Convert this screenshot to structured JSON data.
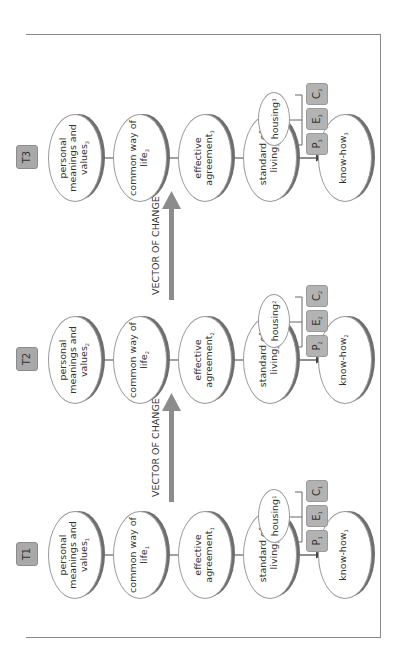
{
  "diagram": {
    "orientation": "rotated -90deg (text reads bottom-to-top)",
    "arrow_color": "#8c8c8c",
    "box_color": "#a9a9a9",
    "ellipse_shadow_color": "#6e6e6e",
    "vector_label": "VECTOR OF CHANGE",
    "stages": [
      {
        "label": "T1",
        "nodes": {
          "values": "personal meanings and values",
          "values_sub": "1",
          "way_of_life": "common way of life",
          "way_of_life_sub": "1",
          "agreement": "effective agreement",
          "agreement_sub": "1",
          "standard": "standard of living",
          "standard_sub": "1",
          "knowhow": "know-how",
          "knowhow_sub": "1"
        },
        "housing": "housing",
        "housing_sub": "1",
        "components": [
          {
            "letter": "P",
            "sub": "1"
          },
          {
            "letter": "E",
            "sub": "1"
          },
          {
            "letter": "C",
            "sub": "1"
          }
        ]
      },
      {
        "label": "T2",
        "nodes": {
          "values": "personal meanings and values",
          "values_sub": "2",
          "way_of_life": "common way of life",
          "way_of_life_sub": "2",
          "agreement": "effective agreement",
          "agreement_sub": "2",
          "standard": "standard of living",
          "standard_sub": "2",
          "knowhow": "know-how",
          "knowhow_sub": "2"
        },
        "housing": "housing",
        "housing_sub": "2",
        "components": [
          {
            "letter": "P",
            "sub": "2"
          },
          {
            "letter": "E",
            "sub": "2"
          },
          {
            "letter": "C",
            "sub": "2"
          }
        ]
      },
      {
        "label": "T3",
        "nodes": {
          "values": "personal meanings and values",
          "values_sub": "3",
          "way_of_life": "common way of life",
          "way_of_life_sub": "3",
          "agreement": "effective agreement",
          "agreement_sub": "3",
          "standard": "standard of living",
          "standard_sub": "3",
          "knowhow": "know-how",
          "knowhow_sub": "3"
        },
        "housing": "housing",
        "housing_sub": "3",
        "components": [
          {
            "letter": "P",
            "sub": "3"
          },
          {
            "letter": "E",
            "sub": "3"
          },
          {
            "letter": "C",
            "sub": "3"
          }
        ]
      }
    ]
  }
}
